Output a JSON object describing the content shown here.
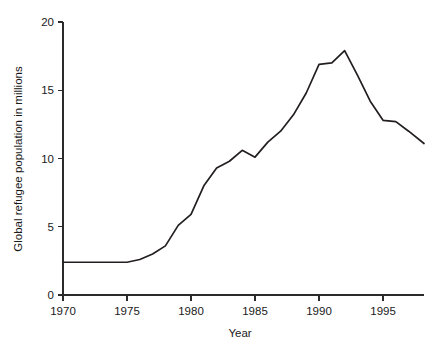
{
  "chart_data": {
    "type": "line",
    "title": "",
    "xlabel": "Year",
    "ylabel": "Global refugee population in millions",
    "xlim": [
      1970,
      1998.2
    ],
    "ylim": [
      0,
      20
    ],
    "xticks": [
      1970,
      1975,
      1980,
      1985,
      1990,
      1995
    ],
    "xtick_labels": [
      "1970",
      "1975",
      "1980",
      "1985",
      "1990",
      "1995"
    ],
    "yticks": [
      0,
      5,
      10,
      15,
      20
    ],
    "ytick_labels": [
      "0",
      "5",
      "10",
      "15",
      "20"
    ],
    "grid": false,
    "legend": "none",
    "line_color": "#231f20",
    "axis_color": "#2b2b2b",
    "series": [
      {
        "name": "Global refugee population",
        "x": [
          1970,
          1971,
          1972,
          1973,
          1974,
          1975,
          1976,
          1977,
          1978,
          1979,
          1980,
          1981,
          1982,
          1983,
          1984,
          1985,
          1986,
          1987,
          1988,
          1989,
          1990,
          1991,
          1992,
          1993,
          1994,
          1995,
          1996,
          1997,
          1998.2
        ],
        "values": [
          2.4,
          2.4,
          2.4,
          2.4,
          2.4,
          2.4,
          2.6,
          3.0,
          3.6,
          5.1,
          5.9,
          8.0,
          9.3,
          9.8,
          10.6,
          10.1,
          11.2,
          12.0,
          13.2,
          14.8,
          16.9,
          17.0,
          17.9,
          16.1,
          14.2,
          12.8,
          12.7,
          12.0,
          11.1
        ]
      }
    ]
  },
  "axis_labels": {
    "y_title": "Global refugee population in millions",
    "x_title": "Year"
  }
}
